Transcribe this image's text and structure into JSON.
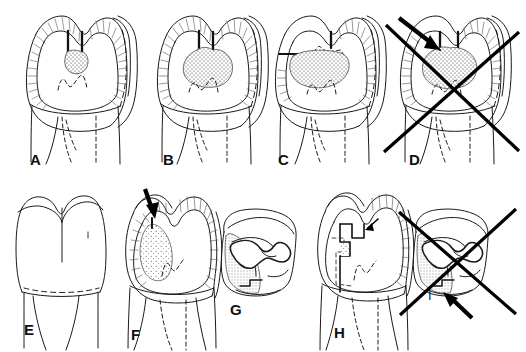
{
  "figure": {
    "background_color": "#ffffff",
    "ink_color": "#1a1a1a",
    "panels": [
      {
        "id": "A",
        "label": "A",
        "label_x": 30,
        "label_y": 152,
        "view": "mesiodistal-section",
        "description": "Molar section with enamel hatching, narrow occlusal fissure and small stippled caries lesion at the dentino-enamel junction",
        "marked_incorrect": false,
        "has_arrow": false
      },
      {
        "id": "B",
        "label": "B",
        "label_x": 163,
        "label_y": 152,
        "view": "mesiodistal-section",
        "description": "Molar section with enlarged stippled caries lesion spreading laterally in dentin beneath the fissure",
        "marked_incorrect": false,
        "has_arrow": false
      },
      {
        "id": "C",
        "label": "C",
        "label_x": 278,
        "label_y": 152,
        "view": "mesiodistal-section",
        "description": "Molar section with undermined enamel and broad dentin caries, dashed outline of affected enamel",
        "marked_incorrect": false,
        "has_arrow": false
      },
      {
        "id": "D",
        "label": "D",
        "label_x": 409,
        "label_y": 152,
        "view": "mesiodistal-section",
        "description": "Molar section with extensive dentin caries; crossed out as an incorrect preparation with arrow indicating the faulty approach",
        "marked_incorrect": true,
        "has_arrow": true
      },
      {
        "id": "E",
        "label": "E",
        "label_x": 24,
        "label_y": 322,
        "view": "buccal-external",
        "description": "Intact premolar/molar external outline, no cavity",
        "marked_incorrect": false,
        "has_arrow": false
      },
      {
        "id": "F",
        "label": "F",
        "label_x": 131,
        "label_y": 327,
        "view": "mesiodistal-section",
        "description": "Tooth section with proximal caries lesion and arrow indicating the access point through the marginal ridge",
        "marked_incorrect": false,
        "has_arrow": true
      },
      {
        "id": "G",
        "label": "G",
        "label_x": 230,
        "label_y": 302,
        "view": "occlusal",
        "description": "Occlusal view of the tooth showing the outlined cavity preparation",
        "marked_incorrect": false,
        "has_arrow": false
      },
      {
        "id": "H",
        "label": "H",
        "label_x": 334,
        "label_y": 325,
        "view": "mesiodistal-section",
        "description": "Tooth section with completed box-shaped cavity preparation and arrow to the axial wall",
        "marked_incorrect": false,
        "has_arrow": true
      },
      {
        "id": "I",
        "label": "I",
        "label_x": 428,
        "label_y": 289,
        "view": "occlusal",
        "description": "Occlusal view crossed out as an incorrect outline form, with arrow pointing at the faulty margin",
        "marked_incorrect": true,
        "has_arrow": true
      }
    ]
  }
}
